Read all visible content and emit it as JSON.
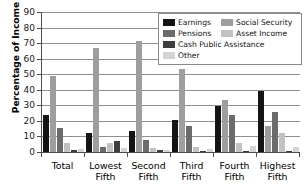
{
  "chart_data": {
    "type": "bar",
    "title": "",
    "xlabel": "",
    "ylabel": "Percentage of Income",
    "ylim": [
      0,
      90
    ],
    "ytick_step": 10,
    "yticks": [
      0,
      10,
      20,
      30,
      40,
      50,
      60,
      70,
      80,
      90
    ],
    "grid": true,
    "legend_position": "top-right-inside",
    "categories": [
      "Total",
      "Lowest Fifth",
      "Second Fifth",
      "Third Fifth",
      "Fourth Fifth",
      "Highest Fifth"
    ],
    "category_lines": [
      [
        "Total"
      ],
      [
        "Lowest",
        "Fifth"
      ],
      [
        "Second",
        "Fifth"
      ],
      [
        "Third",
        "Fifth"
      ],
      [
        "Fourth",
        "Fifth"
      ],
      [
        "Highest",
        "Fifth"
      ]
    ],
    "series": [
      {
        "name": "Earnings",
        "color": "#141414",
        "values": [
          23.5,
          12.5,
          13.5,
          20.5,
          29.5,
          39.5
        ]
      },
      {
        "name": "Social Security",
        "color": "#9e9e9e",
        "values": [
          49.0,
          67.0,
          71.5,
          53.5,
          33.5,
          17.0
        ]
      },
      {
        "name": "Pensions",
        "color": "#6b6b6b",
        "values": [
          15.5,
          3.5,
          7.5,
          16.5,
          23.5,
          25.5
        ]
      },
      {
        "name": "Asset Income",
        "color": "#c2c2c2",
        "values": [
          5.8,
          5.5,
          2.5,
          3.0,
          5.5,
          12.0
        ]
      },
      {
        "name": "Cash Public Assistance",
        "color": "#3d3d3d",
        "values": [
          1.4,
          7.3,
          1.2,
          0.8,
          0.2,
          0.1
        ]
      },
      {
        "name": "Other",
        "color": "#d4d4d4",
        "values": [
          2.2,
          2.3,
          1.5,
          2.2,
          4.0,
          3.5
        ]
      }
    ]
  },
  "legend": {
    "items": [
      {
        "label": "Earnings",
        "color": "#141414",
        "swatch": "legend-swatch-earnings"
      },
      {
        "label": "Social Security",
        "color": "#9e9e9e",
        "swatch": "legend-swatch-social-security"
      },
      {
        "label": "Pensions",
        "color": "#6b6b6b",
        "swatch": "legend-swatch-pensions"
      },
      {
        "label": "Asset Income",
        "color": "#c2c2c2",
        "swatch": "legend-swatch-asset-income"
      },
      {
        "label": "Cash Public Assistance",
        "color": "#3d3d3d",
        "swatch": "legend-swatch-cash-public-assistance"
      },
      {
        "label": "Other",
        "color": "#d4d4d4",
        "swatch": "legend-swatch-other"
      }
    ]
  },
  "axis": {
    "y_title": "Percentage of Income"
  }
}
